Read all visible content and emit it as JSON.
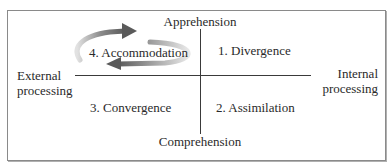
{
  "diagram": {
    "type": "quadrant",
    "axes": {
      "top": "Apprehension",
      "bottom": "Comprehension",
      "left": [
        "External",
        "processing"
      ],
      "right": [
        "Internal",
        "processing"
      ]
    },
    "quadrants": [
      {
        "position": "top-right",
        "label": "1. Divergence"
      },
      {
        "position": "bottom-right",
        "label": "2. Assimilation"
      },
      {
        "position": "bottom-left",
        "label": "3. Convergence"
      },
      {
        "position": "top-left",
        "label": "4. Accommodation"
      }
    ],
    "cycle_arrows": {
      "around": "4. Accommodation",
      "colors": [
        "#6b6b6b",
        "#c8c8c8"
      ]
    }
  }
}
